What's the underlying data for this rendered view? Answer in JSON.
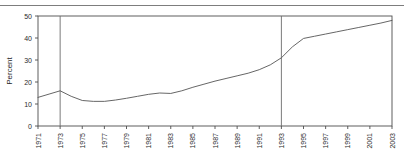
{
  "chart_data": {
    "type": "line",
    "title": "",
    "subtitle": "",
    "xlabel": "",
    "ylabel": "Percent",
    "xlim": [
      1971,
      2003
    ],
    "ylim": [
      0,
      50
    ],
    "yticks": [
      0,
      10,
      20,
      30,
      40,
      50
    ],
    "ytick_labels": [
      "0",
      "10",
      "20",
      "30",
      "40",
      "50"
    ],
    "xticks": [
      1971,
      1973,
      1975,
      1977,
      1979,
      1981,
      1983,
      1985,
      1987,
      1989,
      1991,
      1993,
      1995,
      1997,
      1999,
      2001,
      2003
    ],
    "xtick_labels": [
      "1971",
      "1973",
      "1975",
      "1977",
      "1979",
      "1981",
      "1983",
      "1985",
      "1987",
      "1989",
      "1991",
      "1993",
      "1995",
      "1997",
      "1999",
      "2001",
      "2003"
    ],
    "grid": false,
    "legend": null,
    "legend_position": "none",
    "line_color": "#555555",
    "axis_color": "#4d4d4d",
    "reference_line_color": "#6b6b6b",
    "reference_lines": [
      {
        "x": 1973,
        "label": ""
      },
      {
        "x": 1993,
        "label": ""
      }
    ],
    "x": [
      1971,
      1972,
      1973,
      1974,
      1975,
      1976,
      1977,
      1978,
      1979,
      1980,
      1981,
      1982,
      1983,
      1984,
      1985,
      1986,
      1987,
      1988,
      1989,
      1990,
      1991,
      1992,
      1993,
      1994,
      1995,
      1996,
      1997,
      1998,
      1999,
      2000,
      2001,
      2002,
      2003
    ],
    "values": [
      13.0,
      14.5,
      16.0,
      13.5,
      11.6,
      11.2,
      11.2,
      11.8,
      12.6,
      13.5,
      14.4,
      15.0,
      14.8,
      16.0,
      17.6,
      19.0,
      20.4,
      21.6,
      22.8,
      24.0,
      25.6,
      27.8,
      31.0,
      36.0,
      39.8,
      40.8,
      41.8,
      42.8,
      43.8,
      44.8,
      45.8,
      46.8,
      48.0
    ],
    "series": [
      {
        "name": "Percent",
        "values": [
          13.0,
          14.5,
          16.0,
          13.5,
          11.6,
          11.2,
          11.2,
          11.8,
          12.6,
          13.5,
          14.4,
          15.0,
          14.8,
          16.0,
          17.6,
          19.0,
          20.4,
          21.6,
          22.8,
          24.0,
          25.6,
          27.8,
          31.0,
          36.0,
          39.8,
          40.8,
          41.8,
          42.8,
          43.8,
          44.8,
          45.8,
          46.8,
          48.0
        ]
      }
    ]
  }
}
